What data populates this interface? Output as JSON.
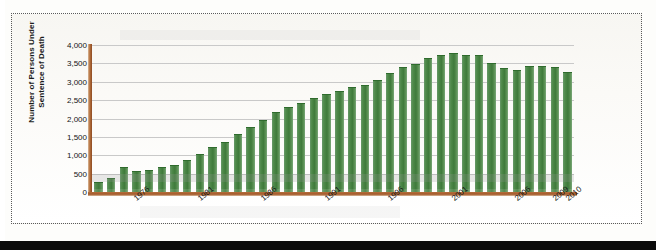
{
  "chart_data": {
    "type": "bar",
    "title": "",
    "subtitle": "",
    "xlabel": "",
    "ylabel": "Number of Persons Under Sentence of Death",
    "ylim": [
      0,
      4000
    ],
    "ytick_labels": [
      "4,000",
      "3,500",
      "3,000",
      "2,500",
      "2,000",
      "1,500",
      "1,000",
      "500",
      "0"
    ],
    "ytick_values": [
      4000,
      3500,
      3000,
      2500,
      2000,
      1500,
      1000,
      500,
      0
    ],
    "grid": true,
    "legend": "none",
    "bar_color": "#4f8a4a",
    "axis_color": "#a3582a",
    "gridline_color": "#c9c9c9",
    "categories": [
      "1973",
      "1974",
      "1975",
      "1976",
      "1977",
      "1978",
      "1979",
      "1980",
      "1981",
      "1982",
      "1983",
      "1984",
      "1985",
      "1986",
      "1987",
      "1988",
      "1989",
      "1990",
      "1991",
      "1992",
      "1993",
      "1994",
      "1995",
      "1996",
      "1997",
      "1998",
      "1999",
      "2000",
      "2001",
      "2002",
      "2003",
      "2004",
      "2005",
      "2006",
      "2007",
      "2008",
      "2009",
      "2010"
    ],
    "values": [
      250,
      350,
      650,
      550,
      560,
      650,
      710,
      840,
      1020,
      1200,
      1330,
      1550,
      1750,
      1940,
      2160,
      2280,
      2390,
      2520,
      2650,
      2710,
      2820,
      2890,
      3030,
      3220,
      3380,
      3450,
      3620,
      3700,
      3750,
      3700,
      3700,
      3470,
      3360,
      3290,
      3400,
      3400,
      3370,
      3250
    ],
    "visible_xtick_labels": [
      "1976",
      "1981",
      "1986",
      "1991",
      "1996",
      "2001",
      "2006",
      "2009",
      "2010"
    ],
    "visible_xtick_categories": [
      "1976",
      "1981",
      "1986",
      "1991",
      "1996",
      "2001",
      "2006",
      "2009",
      "2010"
    ],
    "annotations": []
  }
}
